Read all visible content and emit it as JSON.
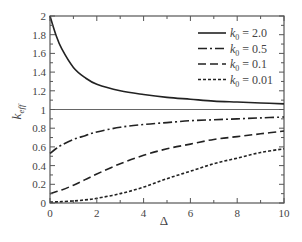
{
  "chart_data": {
    "type": "line",
    "title": "",
    "xlabel": "Δ",
    "ylabel": "k_eff",
    "xlim": [
      0,
      10
    ],
    "ylim": [
      0,
      2
    ],
    "xticks": [
      0,
      2,
      4,
      6,
      8,
      10
    ],
    "yticks": [
      0,
      0.2,
      0.4,
      0.6,
      0.8,
      1,
      1.2,
      1.4,
      1.6,
      1.8,
      2
    ],
    "xtick_labels": [
      "0",
      "2",
      "4",
      "6",
      "8",
      "10"
    ],
    "ytick_labels": [
      "0",
      "0.2",
      "0.4",
      "0.6",
      "0.8",
      "1",
      "1.2",
      "1.4",
      "1.6",
      "1.8",
      "2"
    ],
    "grid": false,
    "legend_position": "upper right",
    "reference_line": {
      "y": 1,
      "style": "solid-thin"
    },
    "x": [
      0,
      0.25,
      0.5,
      1,
      1.5,
      2,
      3,
      4,
      5,
      6,
      7,
      8,
      9,
      10
    ],
    "series": [
      {
        "name": "k0 = 2.0",
        "style": "solid",
        "values": [
          2.0,
          1.8,
          1.65,
          1.45,
          1.34,
          1.27,
          1.2,
          1.16,
          1.13,
          1.11,
          1.09,
          1.08,
          1.07,
          1.06
        ]
      },
      {
        "name": "k0 = 0.5",
        "style": "dash-dot",
        "values": [
          0.53,
          0.58,
          0.62,
          0.68,
          0.72,
          0.76,
          0.81,
          0.84,
          0.86,
          0.88,
          0.89,
          0.9,
          0.91,
          0.92
        ]
      },
      {
        "name": "k0 = 0.1",
        "style": "dashed",
        "values": [
          0.1,
          0.12,
          0.14,
          0.19,
          0.25,
          0.31,
          0.42,
          0.51,
          0.58,
          0.63,
          0.68,
          0.71,
          0.74,
          0.77
        ]
      },
      {
        "name": "k0 = 0.01",
        "style": "dotted",
        "values": [
          0.01,
          0.012,
          0.015,
          0.022,
          0.033,
          0.05,
          0.1,
          0.17,
          0.26,
          0.34,
          0.42,
          0.48,
          0.54,
          0.58
        ]
      }
    ]
  },
  "legend": {
    "items": [
      {
        "sym": "k",
        "sub": "0",
        "text": " = 2.0"
      },
      {
        "sym": "k",
        "sub": "0",
        "text": " = 0.5"
      },
      {
        "sym": "k",
        "sub": "0",
        "text": " = 0.1"
      },
      {
        "sym": "k",
        "sub": "0",
        "text": " = 0.01"
      }
    ]
  },
  "axes": {
    "xlabel": "Δ",
    "ylabel_main": "k",
    "ylabel_sub": "eff"
  }
}
